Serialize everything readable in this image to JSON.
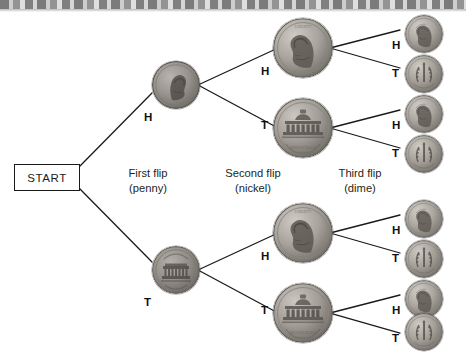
{
  "diagram": {
    "start_label": "START",
    "background_color": "#ffffff",
    "line_color": "#1a1a1a",
    "text_color": "#231f20"
  },
  "stages": [
    {
      "name": "first-flip",
      "title": "First flip",
      "coin_name": "(penny)"
    },
    {
      "name": "second-flip",
      "title": "Second flip",
      "coin_name": "(nickel)"
    },
    {
      "name": "third-flip",
      "title": "Third flip",
      "coin_name": "(dime)"
    }
  ],
  "branch_labels": {
    "heads": "H",
    "tails": "T"
  },
  "level1": [
    {
      "outcome": "H",
      "coin": "penny-heads"
    },
    {
      "outcome": "T",
      "coin": "penny-tails"
    }
  ],
  "level2": [
    {
      "outcome": "H",
      "coin": "nickel-heads"
    },
    {
      "outcome": "T",
      "coin": "nickel-tails"
    },
    {
      "outcome": "H",
      "coin": "nickel-heads"
    },
    {
      "outcome": "T",
      "coin": "nickel-tails"
    }
  ],
  "level3": [
    {
      "outcome": "H",
      "coin": "dime-heads"
    },
    {
      "outcome": "T",
      "coin": "dime-tails"
    },
    {
      "outcome": "H",
      "coin": "dime-heads"
    },
    {
      "outcome": "T",
      "coin": "dime-tails"
    },
    {
      "outcome": "H",
      "coin": "dime-heads"
    },
    {
      "outcome": "T",
      "coin": "dime-tails"
    },
    {
      "outcome": "H",
      "coin": "dime-heads"
    },
    {
      "outcome": "T",
      "coin": "dime-tails"
    }
  ]
}
